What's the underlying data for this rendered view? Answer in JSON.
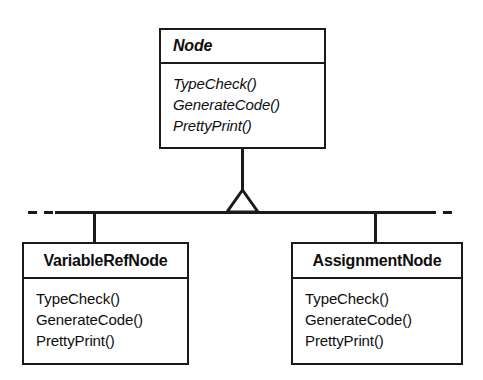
{
  "diagram": {
    "type": "uml-class-diagram",
    "relationship": "generalization",
    "line_color": "#1a1a1a",
    "background_color": "#ffffff",
    "classes": [
      {
        "id": "node",
        "name": "Node",
        "abstract": true,
        "title_alignment": "left",
        "operations": [
          "TypeCheck()",
          "GenerateCode()",
          "PrettyPrint()"
        ]
      },
      {
        "id": "variablerefnode",
        "name": "VariableRefNode",
        "abstract": false,
        "title_alignment": "center",
        "operations": [
          "TypeCheck()",
          "GenerateCode()",
          "PrettyPrint()"
        ]
      },
      {
        "id": "assignmentnode",
        "name": "AssignmentNode",
        "abstract": false,
        "title_alignment": "center",
        "operations": [
          "TypeCheck()",
          "GenerateCode()",
          "PrettyPrint()"
        ]
      }
    ],
    "connector": {
      "kind": "inheritance-triangle",
      "hollow": true,
      "bar_has_dashed_ends": true,
      "dashed_ends_meaning": "additional subclasses elided"
    }
  }
}
